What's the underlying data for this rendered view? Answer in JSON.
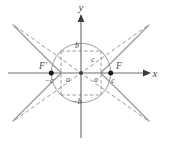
{
  "figure": {
    "type": "hyperbola-diagram",
    "title": "",
    "background_color": "#ffffff",
    "curve_color": "#9a9a9a",
    "axis_color": "#6e6e6e",
    "dash_color": "#8c8c8c",
    "circle_color": "#9a9a9a",
    "label_color": "#4a4a4a",
    "point_color": "#1a1a1a"
  },
  "axes": {
    "x_label": "x",
    "y_label": "y",
    "origin_x": 81,
    "origin_y": 73,
    "x_arrow": true,
    "y_arrow": true
  },
  "geometry": {
    "a": 20,
    "b": 22,
    "c": 29.7,
    "circle_radius": 29.7
  },
  "points": [
    {
      "name": "left-focus",
      "label": "F'",
      "x": -29.7,
      "y": 0
    },
    {
      "name": "right-focus",
      "label": "F",
      "x": 29.7,
      "y": 0
    },
    {
      "name": "origin",
      "label": "",
      "x": 0,
      "y": 0
    }
  ],
  "labels": {
    "focus_left": "F'",
    "focus_right": "F",
    "neg_c": "−c",
    "pos_c": "c",
    "neg_a": "a",
    "pos_a": "a",
    "pos_b": "b",
    "neg_b": "−b",
    "hypotenuse_c": "c",
    "x_axis": "x",
    "y_axis": "y"
  },
  "elements": {
    "circle": "circle of radius c centered at origin",
    "rectangle": "dashed rectangle with corners (±a, ±b)",
    "asymptotes": "two dashed diagonal lines through origin",
    "branches": "hyperbola opening left and right"
  }
}
